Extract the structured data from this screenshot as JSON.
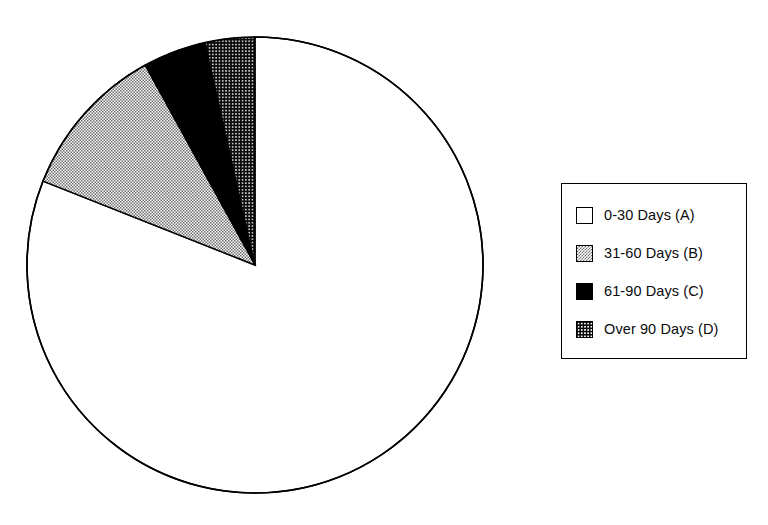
{
  "figure": {
    "background_color": "#ffffff",
    "outline_color": "#000000"
  },
  "chart_data": {
    "type": "pie",
    "title": "",
    "xlabel": "",
    "ylabel": "",
    "grid": false,
    "legend_position": "right",
    "start_angle_deg": 90,
    "direction": "counterclockwise",
    "center_px": [
      255,
      265
    ],
    "radius_px": 228,
    "categories": [
      "0-30 Days (A)",
      "31-60 Days (B)",
      "61-90 Days (C)",
      "Over 90 Days (D)"
    ],
    "short_labels": [
      "A",
      "B",
      "C",
      "D"
    ],
    "values": [
      81.0,
      11.0,
      4.5,
      3.5
    ],
    "angles_deg": [
      291.6,
      39.6,
      16.2,
      12.6
    ],
    "fills": [
      "white",
      "gray-checker",
      "solid-black",
      "black-dotted"
    ],
    "fill_colors": [
      "#ffffff",
      "#8a8a8a",
      "#000000",
      "#111111"
    ]
  },
  "legend": {
    "border_color": "#000000",
    "items": [
      {
        "label": "0-30  Days  (A)",
        "swatch": "white-swatch"
      },
      {
        "label": "31-60  Days  (B)",
        "swatch": "gray-checker-swatch"
      },
      {
        "label": "61-90  Days  (C)",
        "swatch": "solid-black-swatch"
      },
      {
        "label": "Over 90  Days  (D)",
        "swatch": "black-dotted-swatch"
      }
    ]
  }
}
